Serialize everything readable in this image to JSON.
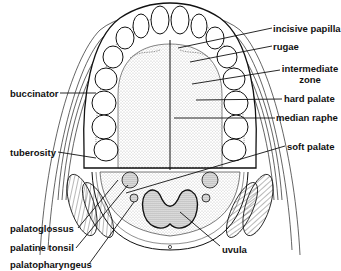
{
  "diagram": {
    "labels": {
      "incisive_papilla": "incisive papilla",
      "rugae": "rugae",
      "intermediate_zone_1": "intermediate",
      "intermediate_zone_2": "zone",
      "hard_palate": "hard palate",
      "median_raphe": "median raphe",
      "soft_palate": "soft palate",
      "buccinator": "buccinator",
      "tuberosity": "tuberosity",
      "palatoglossus": "palatoglossus",
      "palatine_tonsil": "palatine tonsil",
      "palatopharyngeus": "palatopharyngeus",
      "uvula": "uvula"
    },
    "colors": {
      "ink": "#111111",
      "stipple": "#888888",
      "background": "#ffffff"
    }
  }
}
